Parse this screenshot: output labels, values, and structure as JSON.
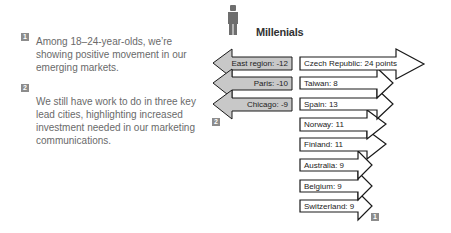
{
  "notes": [
    {
      "badge": "1",
      "text": "Among 18–24-year-olds, we’re showing positive movement in our emerging markets."
    },
    {
      "badge": "2",
      "text": "We still have work to do in three key lead cities, highlighting increased investment needed in our marketing communications."
    }
  ],
  "diagram": {
    "title": "Millenials",
    "icon": "person-icon",
    "negative": [
      {
        "label": "East region:  -12",
        "name": "East region",
        "value": -12
      },
      {
        "label": "Paris:  -10",
        "name": "Paris",
        "value": -10
      },
      {
        "label": "Chicago:  -9",
        "name": "Chicago",
        "value": -9
      }
    ],
    "positive": [
      {
        "label": "Czech Republic:  24 points",
        "name": "Czech Republic",
        "value": 24
      },
      {
        "label": "Taiwan:  8",
        "name": "Taiwan",
        "value": 8
      },
      {
        "label": "Spain:  13",
        "name": "Spain",
        "value": 13
      },
      {
        "label": "Norway:  11",
        "name": "Norway",
        "value": 11
      },
      {
        "label": "Finland:  11",
        "name": "Finland",
        "value": 11
      },
      {
        "label": "Australia:  9",
        "name": "Australia",
        "value": 9
      },
      {
        "label": "Belgium:  9",
        "name": "Belgium",
        "value": 9
      },
      {
        "label": "Switzerland:  9",
        "name": "Switzerland",
        "value": 9
      }
    ],
    "negative_badge": "2",
    "positive_badge": "1",
    "colors": {
      "negative_fill": "#c8c8c8",
      "positive_fill": "#ffffff",
      "stroke": "#1a1a1a",
      "badge": "#8c8c8c",
      "icon": "#6e6e6e"
    }
  }
}
